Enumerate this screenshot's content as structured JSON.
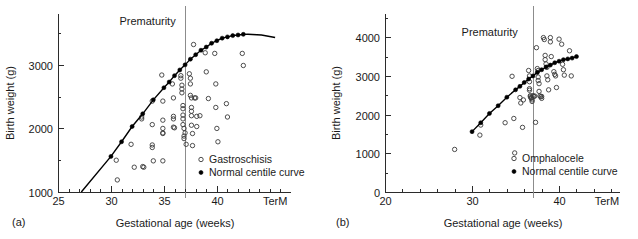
{
  "figure": {
    "background_color": "#ffffff",
    "axis_color": "#2b2b2b",
    "marker_color": "#000000",
    "prematurity_line_color": "#8c8c8c"
  },
  "panel_a": {
    "panel_label": "(a)",
    "annotation": "Prematurity",
    "xlabel": "Gestational age (weeks)",
    "ylabel": "Birth weight (g)",
    "legend": [
      {
        "marker": "open-circle-marker",
        "label": "Gastroschisis"
      },
      {
        "marker": "filled-dot-marker",
        "label": "Normal centile curve"
      }
    ]
  },
  "panel_b": {
    "panel_label": "(b)",
    "annotation": "Prematurity",
    "xlabel": "Gestational age (weeks)",
    "ylabel": "Birth weight (g)",
    "legend": [
      {
        "marker": "open-circle-marker",
        "label": "Omphalocele"
      },
      {
        "marker": "filled-dot-marker",
        "label": "Normal centile curve"
      }
    ]
  },
  "chart_data": [
    {
      "id": "panel-a",
      "type": "scatter",
      "title": "",
      "xlabel": "Gestational age (weeks)",
      "ylabel": "Birth weight (g)",
      "xlim": [
        25,
        47
      ],
      "ylim": [
        1000,
        3800
      ],
      "grid": false,
      "legend_position": "bottom-right",
      "xticks": [
        25,
        30,
        35,
        40
      ],
      "xticklabels": [
        "25",
        "30",
        "35",
        "40",
        "TerM"
      ],
      "xtick_term_value": 45.5,
      "xminor_step": 1,
      "yticks": [
        1000,
        2000,
        3000
      ],
      "yticklabels": [
        "1000",
        "2000",
        "3000"
      ],
      "yminor_step": 500,
      "annotations": [
        {
          "text": "Prematurity",
          "x": 30.8,
          "y": 3620
        },
        {
          "text": "(a)",
          "x": 25.0,
          "y": 760
        }
      ],
      "vertical_line": {
        "x": 37,
        "label": "prematurity threshold"
      },
      "series": [
        {
          "name": "Gastroschisis",
          "marker": "open-circle",
          "points": [
            [
              30.5,
              1500
            ],
            [
              30.6,
              1190
            ],
            [
              31.9,
              1750
            ],
            [
              32.2,
              1390
            ],
            [
              32.9,
              2180
            ],
            [
              32.9,
              2150
            ],
            [
              33.0,
              1400
            ],
            [
              33.1,
              1390
            ],
            [
              33.9,
              2430
            ],
            [
              33.9,
              2060
            ],
            [
              33.9,
              1740
            ],
            [
              33.9,
              1700
            ],
            [
              34.0,
              1490
            ],
            [
              34.8,
              2840
            ],
            [
              34.9,
              2430
            ],
            [
              34.9,
              2130
            ],
            [
              34.9,
              2000
            ],
            [
              34.9,
              1930
            ],
            [
              34.9,
              1920
            ],
            [
              34.9,
              1490
            ],
            [
              35.8,
              2700
            ],
            [
              35.9,
              2480
            ],
            [
              35.9,
              2190
            ],
            [
              35.9,
              2150
            ],
            [
              35.9,
              2020
            ],
            [
              36.0,
              2010
            ],
            [
              36.6,
              2830
            ],
            [
              36.6,
              2790
            ],
            [
              36.7,
              2680
            ],
            [
              36.7,
              2620
            ],
            [
              36.7,
              2560
            ],
            [
              36.8,
              2360
            ],
            [
              36.8,
              2310
            ],
            [
              36.8,
              2210
            ],
            [
              36.8,
              2150
            ],
            [
              36.8,
              2060
            ],
            [
              36.9,
              2000
            ],
            [
              36.9,
              1880
            ],
            [
              36.9,
              1840
            ],
            [
              37.0,
              1930
            ],
            [
              37.1,
              1750
            ],
            [
              37.4,
              2860
            ],
            [
              37.5,
              2790
            ],
            [
              37.5,
              2700
            ],
            [
              37.5,
              2520
            ],
            [
              37.6,
              2480
            ],
            [
              37.6,
              2330
            ],
            [
              37.6,
              2270
            ],
            [
              37.6,
              2200
            ],
            [
              37.6,
              2050
            ],
            [
              37.7,
              1920
            ],
            [
              37.7,
              1730
            ],
            [
              37.8,
              3320
            ],
            [
              37.9,
              2480
            ],
            [
              38.0,
              2480
            ],
            [
              38.1,
              2190
            ],
            [
              38.1,
              2030
            ],
            [
              38.4,
              2200
            ],
            [
              38.9,
              3190
            ],
            [
              39.0,
              2890
            ],
            [
              39.2,
              2470
            ],
            [
              39.8,
              3180
            ],
            [
              39.9,
              2700
            ],
            [
              39.9,
              2330
            ],
            [
              40.0,
              2000
            ],
            [
              40.1,
              1790
            ],
            [
              40.9,
              2390
            ],
            [
              41.0,
              2180
            ],
            [
              42.4,
              3180
            ],
            [
              42.5,
              2990
            ]
          ]
        },
        {
          "name": "Normal centile curve",
          "marker": "filled-dot",
          "line": true,
          "points": [
            [
              30.0,
              1560
            ],
            [
              31.0,
              1790
            ],
            [
              32.0,
              2030
            ],
            [
              33.0,
              2230
            ],
            [
              34.0,
              2450
            ],
            [
              35.0,
              2640
            ],
            [
              35.5,
              2730
            ],
            [
              36.0,
              2830
            ],
            [
              36.5,
              2920
            ],
            [
              37.0,
              3000
            ],
            [
              37.5,
              3090
            ],
            [
              38.0,
              3160
            ],
            [
              38.5,
              3230
            ],
            [
              39.0,
              3280
            ],
            [
              39.5,
              3340
            ],
            [
              40.0,
              3380
            ],
            [
              40.5,
              3420
            ],
            [
              41.0,
              3440
            ],
            [
              41.5,
              3460
            ],
            [
              42.0,
              3470
            ],
            [
              42.5,
              3480
            ]
          ],
          "line_extends_to": [
            27.2,
            1000
          ],
          "line_tail_to": [
            45.5,
            3430
          ]
        }
      ]
    },
    {
      "id": "panel-b",
      "type": "scatter",
      "title": "",
      "xlabel": "Gestational age (weeks)",
      "ylabel": "Birth weight (g)",
      "xlim": [
        20,
        47
      ],
      "ylim": [
        0,
        4600
      ],
      "grid": false,
      "legend_position": "bottom-right",
      "xticks": [
        20,
        30,
        40
      ],
      "xticklabels": [
        "20",
        "30",
        "40",
        "TerM"
      ],
      "xtick_term_value": 45.5,
      "xminor_step": 2,
      "yticks": [
        0,
        1000,
        2000,
        3000,
        4000
      ],
      "yticklabels": [
        "0",
        "1000",
        "2000",
        "3000",
        "4000"
      ],
      "yminor_step": 500,
      "annotations": [
        {
          "text": "Prematurity",
          "x": 28.8,
          "y": 4020
        },
        {
          "text": "(b)",
          "x": 20.0,
          "y": -620
        }
      ],
      "vertical_line": {
        "x": 37,
        "label": "prematurity threshold"
      },
      "series": [
        {
          "name": "Omphalocele",
          "marker": "open-circle",
          "points": [
            [
              28.0,
              1100
            ],
            [
              30.9,
              1470
            ],
            [
              31.0,
              1730
            ],
            [
              33.8,
              1790
            ],
            [
              34.6,
              2990
            ],
            [
              34.8,
              1900
            ],
            [
              34.9,
              1010
            ],
            [
              35.5,
              2440
            ],
            [
              35.6,
              2300
            ],
            [
              35.8,
              1670
            ],
            [
              35.9,
              2380
            ],
            [
              36.5,
              3140
            ],
            [
              36.6,
              3000
            ],
            [
              36.6,
              2850
            ],
            [
              36.6,
              2670
            ],
            [
              36.6,
              2630
            ],
            [
              36.7,
              2490
            ],
            [
              36.7,
              2460
            ],
            [
              36.8,
              2440
            ],
            [
              36.8,
              2420
            ],
            [
              36.9,
              2380
            ],
            [
              36.9,
              2340
            ],
            [
              37.0,
              2490
            ],
            [
              37.1,
              2470
            ],
            [
              37.2,
              2480
            ],
            [
              37.3,
              1800
            ],
            [
              37.4,
              3730
            ],
            [
              37.5,
              3190
            ],
            [
              37.6,
              3140
            ],
            [
              37.6,
              2970
            ],
            [
              37.6,
              2880
            ],
            [
              37.7,
              2800
            ],
            [
              37.7,
              2600
            ],
            [
              37.8,
              2480
            ],
            [
              37.9,
              2460
            ],
            [
              38.0,
              2470
            ],
            [
              38.0,
              2420
            ],
            [
              38.2,
              3990
            ],
            [
              38.3,
              3940
            ],
            [
              38.4,
              3530
            ],
            [
              38.4,
              3420
            ],
            [
              38.5,
              3310
            ],
            [
              38.6,
              3220
            ],
            [
              38.6,
              3000
            ],
            [
              38.7,
              2900
            ],
            [
              38.8,
              2640
            ],
            [
              39.0,
              3990
            ],
            [
              39.0,
              3880
            ],
            [
              39.1,
              3500
            ],
            [
              39.4,
              3110
            ],
            [
              39.5,
              3040
            ],
            [
              39.6,
              3000
            ],
            [
              39.7,
              2700
            ],
            [
              40.0,
              3950
            ],
            [
              40.3,
              3820
            ],
            [
              40.4,
              3300
            ],
            [
              40.5,
              3160
            ],
            [
              40.6,
              3020
            ],
            [
              41.2,
              3650
            ],
            [
              41.4,
              3000
            ]
          ]
        },
        {
          "name": "Normal centile curve",
          "marker": "filled-dot",
          "line": true,
          "points": [
            [
              30.0,
              1560
            ],
            [
              31.0,
              1790
            ],
            [
              32.0,
              2030
            ],
            [
              33.0,
              2230
            ],
            [
              34.0,
              2450
            ],
            [
              35.0,
              2640
            ],
            [
              35.5,
              2730
            ],
            [
              36.0,
              2830
            ],
            [
              36.5,
              2920
            ],
            [
              37.0,
              3000
            ],
            [
              37.5,
              3090
            ],
            [
              38.0,
              3160
            ],
            [
              38.5,
              3230
            ],
            [
              39.0,
              3280
            ],
            [
              39.5,
              3340
            ],
            [
              40.0,
              3380
            ],
            [
              40.5,
              3420
            ],
            [
              41.0,
              3440
            ],
            [
              41.5,
              3460
            ],
            [
              42.0,
              3500
            ]
          ]
        }
      ]
    }
  ]
}
